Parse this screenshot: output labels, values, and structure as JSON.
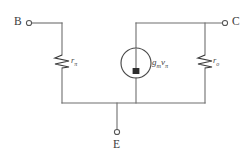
{
  "figure": {
    "name": "bjt-hybrid-pi-small-signal-model",
    "background_color": "#ffffff",
    "line_color": "#6e6e6e"
  },
  "terminals": [
    {
      "id": "base",
      "label": "B",
      "position": "top-left"
    },
    {
      "id": "collector",
      "label": "C",
      "position": "top-right"
    },
    {
      "id": "emitter",
      "label": "E",
      "position": "bottom-center"
    }
  ],
  "components": [
    {
      "id": "r-pi",
      "type": "resistor",
      "label_main": "r",
      "label_sub": "π",
      "label_full": "rπ",
      "orientation": "vertical",
      "branch": "base-to-emitter"
    },
    {
      "id": "r-o",
      "type": "resistor",
      "label_main": "r",
      "label_sub": "o",
      "label_full": "ro",
      "orientation": "vertical",
      "branch": "collector-to-emitter"
    },
    {
      "id": "gm-vpi-source",
      "type": "dependent-current-source",
      "label_main": "g",
      "label_sub1": "m",
      "label_mid": "v",
      "label_sub2": "π",
      "label_full": "gmvπ",
      "arrow_direction": "down",
      "branch": "collector-to-emitter"
    }
  ]
}
